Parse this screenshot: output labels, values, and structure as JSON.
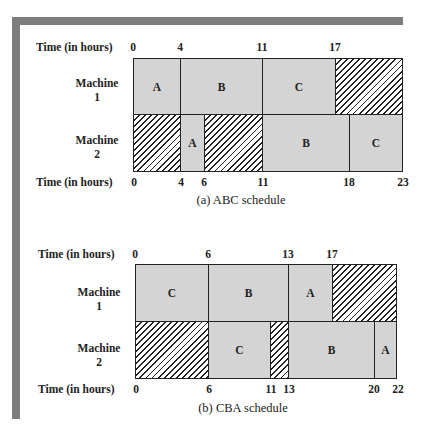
{
  "schedules": [
    {
      "caption": "(a) ABC schedule",
      "time_label": "Time (in hours)",
      "machines": [
        {
          "label_line1": "Machine",
          "label_line2": "1",
          "blocks": [
            {
              "type": "job",
              "label": "A",
              "start": 0,
              "end": 4
            },
            {
              "type": "job",
              "label": "B",
              "start": 4,
              "end": 11
            },
            {
              "type": "job",
              "label": "C",
              "start": 11,
              "end": 17
            },
            {
              "type": "idle",
              "label": "",
              "start": 17,
              "end": 23
            }
          ]
        },
        {
          "label_line1": "Machine",
          "label_line2": "2",
          "blocks": [
            {
              "type": "idle",
              "label": "",
              "start": 0,
              "end": 4
            },
            {
              "type": "job",
              "label": "A",
              "start": 4,
              "end": 6
            },
            {
              "type": "idle",
              "label": "",
              "start": 6,
              "end": 11
            },
            {
              "type": "job",
              "label": "B",
              "start": 11,
              "end": 18
            },
            {
              "type": "job",
              "label": "C",
              "start": 18,
              "end": 23
            }
          ]
        }
      ],
      "top_ticks": [
        "0",
        "4",
        "11",
        "17"
      ],
      "bottom_ticks": [
        "0",
        "4",
        "6",
        "11",
        "18",
        "23"
      ]
    },
    {
      "caption": "(b) CBA schedule",
      "time_label": "Time (in hours)",
      "machines": [
        {
          "label_line1": "Machine",
          "label_line2": "1",
          "blocks": [
            {
              "type": "job",
              "label": "C",
              "start": 0,
              "end": 6
            },
            {
              "type": "job",
              "label": "B",
              "start": 6,
              "end": 13
            },
            {
              "type": "job",
              "label": "A",
              "start": 13,
              "end": 17
            },
            {
              "type": "idle",
              "label": "",
              "start": 17,
              "end": 22
            }
          ]
        },
        {
          "label_line1": "Machine",
          "label_line2": "2",
          "blocks": [
            {
              "type": "idle",
              "label": "",
              "start": 0,
              "end": 6
            },
            {
              "type": "job",
              "label": "C",
              "start": 6,
              "end": 11
            },
            {
              "type": "idle",
              "label": "",
              "start": 11,
              "end": 13
            },
            {
              "type": "job",
              "label": "B",
              "start": 13,
              "end": 20
            },
            {
              "type": "job",
              "label": "A",
              "start": 20,
              "end": 22
            }
          ]
        }
      ],
      "top_ticks": [
        "0",
        "6",
        "13",
        "17"
      ],
      "bottom_ticks": [
        "0",
        "6",
        "11",
        "13",
        "20",
        "22"
      ]
    }
  ],
  "colors": {
    "job_fill": "#d4d4d4",
    "frame": "#7d7d7d",
    "line": "#222222"
  }
}
